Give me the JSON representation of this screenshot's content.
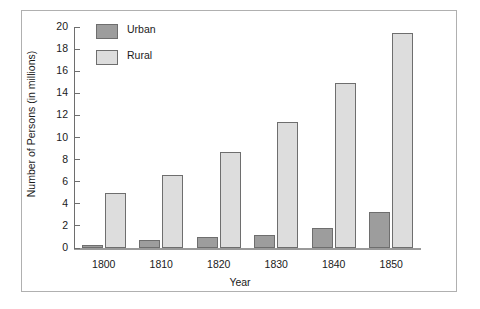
{
  "chart_data": {
    "type": "bar",
    "title": "",
    "xlabel": "Year",
    "ylabel": "Number of Persons (in millions)",
    "categories": [
      "1800",
      "1810",
      "1820",
      "1830",
      "1840",
      "1850"
    ],
    "series": [
      {
        "name": "Urban",
        "color": "#9d9d9d",
        "values": [
          0.3,
          0.7,
          1.0,
          1.2,
          1.8,
          3.3
        ]
      },
      {
        "name": "Rural",
        "color": "#dddddd",
        "values": [
          5.0,
          6.6,
          8.7,
          11.4,
          14.9,
          19.5
        ]
      }
    ],
    "ylim": [
      0,
      20
    ],
    "yticks": [
      "0",
      "2",
      "4",
      "6",
      "8",
      "10",
      "12",
      "14",
      "16",
      "18",
      "20"
    ],
    "grid": false,
    "legend_position": "top-left-inside"
  },
  "legend": {
    "items": [
      {
        "label": "Urban"
      },
      {
        "label": "Rural"
      }
    ]
  }
}
